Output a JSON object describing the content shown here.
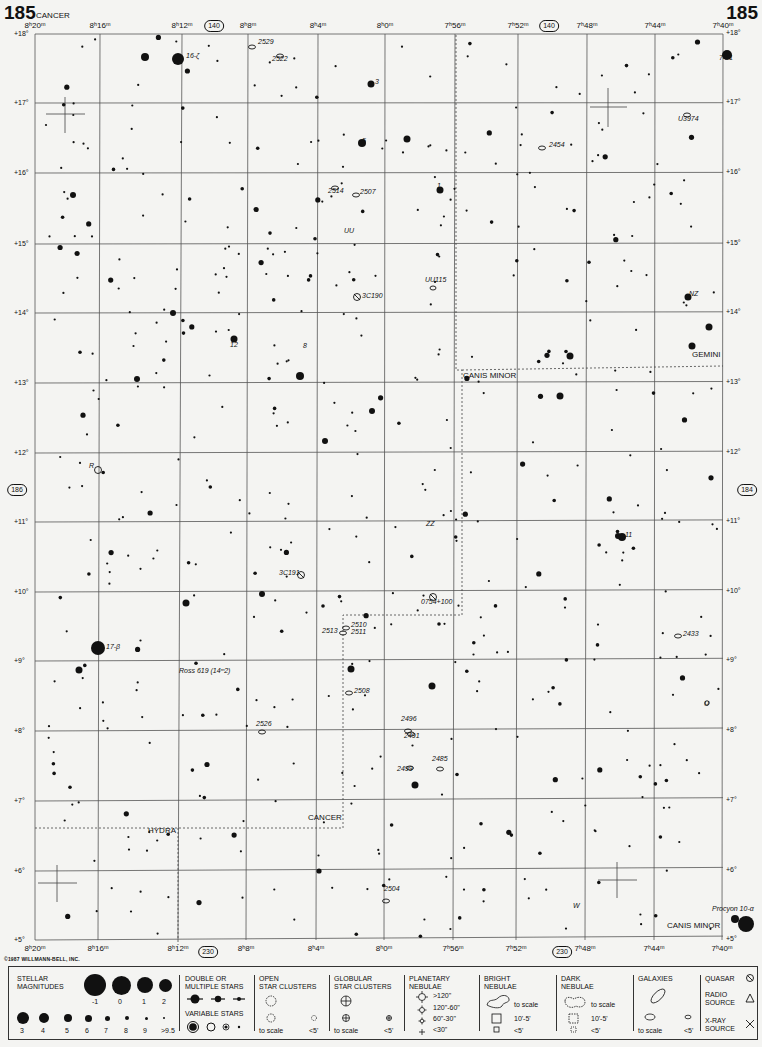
{
  "chart_number": "185",
  "ra_labels_top": [
    "8h20m",
    "8h16m",
    "8h12m",
    "8h8m",
    "8h4m",
    "8h0m",
    "7h56m",
    "7h52m",
    "7h48m",
    "7h44m",
    "7h40m"
  ],
  "ra_labels_bottom": [
    "8h20m",
    "8h16m",
    "8h12m",
    "8h8m",
    "8h4m",
    "8h0m",
    "7h56m",
    "7h52m",
    "7h48m",
    "7h44m",
    "7h40m"
  ],
  "dec_labels": [
    "+18°",
    "+17°",
    "+16°",
    "+15°",
    "+14°",
    "+13°",
    "+12°",
    "+11°",
    "+10°",
    "+9°",
    "+8°",
    "+7°",
    "+6°",
    "+5°"
  ],
  "adjacent_charts": {
    "top": "140",
    "bottom": "230",
    "left": "186",
    "right": "184"
  },
  "constellations": [
    {
      "name": "CANCER",
      "x": 36,
      "y": 18
    },
    {
      "name": "GEMINI",
      "x": 692,
      "y": 357
    },
    {
      "name": "CANIS MINOR",
      "x": 463,
      "y": 378
    },
    {
      "name": "CANCER",
      "x": 308,
      "y": 820
    },
    {
      "name": "HYDRA",
      "x": 148,
      "y": 833
    },
    {
      "name": "CANIS MINOR",
      "x": 667,
      "y": 928
    }
  ],
  "object_labels": [
    {
      "text": "16-ζ",
      "x": 186,
      "y": 58
    },
    {
      "text": "2529",
      "x": 258,
      "y": 44
    },
    {
      "text": "2522",
      "x": 272,
      "y": 61
    },
    {
      "text": "3",
      "x": 375,
      "y": 84
    },
    {
      "text": "5",
      "x": 362,
      "y": 143
    },
    {
      "text": "1",
      "x": 437,
      "y": 188
    },
    {
      "text": "2514",
      "x": 328,
      "y": 193
    },
    {
      "text": "2507",
      "x": 360,
      "y": 194
    },
    {
      "text": "UU",
      "x": 344,
      "y": 233
    },
    {
      "text": "UU115",
      "x": 425,
      "y": 282
    },
    {
      "text": "3C190",
      "x": 362,
      "y": 298
    },
    {
      "text": "12",
      "x": 230,
      "y": 347
    },
    {
      "text": "8",
      "x": 303,
      "y": 348
    },
    {
      "text": "NZ",
      "x": 689,
      "y": 296
    },
    {
      "text": "74-1",
      "x": 719,
      "y": 60
    },
    {
      "text": "U3974",
      "x": 678,
      "y": 121
    },
    {
      "text": "2454",
      "x": 549,
      "y": 147
    },
    {
      "text": "R",
      "x": 89,
      "y": 468
    },
    {
      "text": "ZZ",
      "x": 426,
      "y": 526
    },
    {
      "text": "11",
      "x": 625,
      "y": 537
    },
    {
      "text": "3C191",
      "x": 279,
      "y": 575
    },
    {
      "text": "0754+100",
      "x": 421,
      "y": 604
    },
    {
      "text": "2510",
      "x": 351,
      "y": 627
    },
    {
      "text": "2513",
      "x": 322,
      "y": 633
    },
    {
      "text": "2511",
      "x": 351,
      "y": 634
    },
    {
      "text": "2433",
      "x": 683,
      "y": 636
    },
    {
      "text": "17-β",
      "x": 106,
      "y": 649
    },
    {
      "text": "Ross 619 (14ᵐ2)",
      "x": 179,
      "y": 673
    },
    {
      "text": "2508",
      "x": 354,
      "y": 693
    },
    {
      "text": "U",
      "x": 704,
      "y": 706
    },
    {
      "text": "2526",
      "x": 256,
      "y": 726
    },
    {
      "text": "2496",
      "x": 401,
      "y": 721
    },
    {
      "text": "2491",
      "x": 404,
      "y": 738
    },
    {
      "text": "2485",
      "x": 432,
      "y": 761
    },
    {
      "text": "2499",
      "x": 397,
      "y": 771
    },
    {
      "text": "2504",
      "x": 384,
      "y": 891
    },
    {
      "text": "W",
      "x": 573,
      "y": 908
    },
    {
      "text": "Procyon 10-α",
      "x": 712,
      "y": 911
    }
  ],
  "copyright": "©1987 WILLMANN-BELL, INC.",
  "legend": {
    "stellar_magnitudes": {
      "title_line1": "STELLAR",
      "title_line2": "MAGNITUDES",
      "row1": [
        "-1",
        "0",
        "1",
        "2"
      ],
      "row2": [
        "3",
        "4",
        "5",
        "6",
        "7",
        "8",
        "9",
        ">9.5"
      ]
    },
    "double_stars": {
      "title_line1": "DOUBLE OR",
      "title_line2": "MULTIPLE STARS"
    },
    "variable_stars": {
      "title": "VARIABLE STARS"
    },
    "open_clusters": {
      "title_line1": "OPEN",
      "title_line2": "STAR CLUSTERS",
      "to_scale": "to scale",
      "small": "<5'"
    },
    "globular_clusters": {
      "title_line1": "GLOBULAR",
      "title_line2": "STAR CLUSTERS",
      "to_scale": "to scale",
      "small": "<5'"
    },
    "planetary_nebulae": {
      "title_line1": "PLANETARY",
      "title_line2": "NEBULAE",
      "sizes": [
        ">120\"",
        "120\"-60\"",
        "60\"-30\"",
        "<30\""
      ]
    },
    "bright_nebulae": {
      "title_line1": "BRIGHT",
      "title_line2": "NEBULAE",
      "to_scale": "to scale",
      "mid": "10'-5'",
      "small": "<5'"
    },
    "dark_nebulae": {
      "title_line1": "DARK",
      "title_line2": "NEBULAE",
      "to_scale": "to scale",
      "mid": "10'-5'",
      "small": "<5'"
    },
    "galaxies": {
      "title": "GALAXIES",
      "to_scale": "to scale",
      "small": "<5'"
    },
    "quasar": {
      "title": "QUASAR"
    },
    "radio_source": {
      "title_line1": "RADIO",
      "title_line2": "SOURCE"
    },
    "xray_source": {
      "title_line1": "X-RAY",
      "title_line2": "SOURCE"
    }
  }
}
